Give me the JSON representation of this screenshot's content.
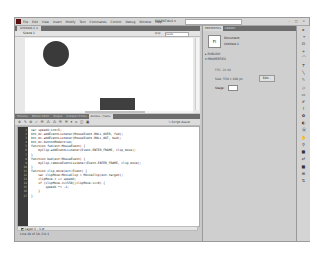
{
  "menubar": {
    "items": [
      "File",
      "Edit",
      "View",
      "Insert",
      "Modify",
      "Text",
      "Commands",
      "Control",
      "Debug",
      "Window",
      "Help"
    ],
    "workspace": "ESSENTIALS ▾",
    "window_buttons": "– □ ×"
  },
  "document": {
    "tab": "Untitled-1 ×",
    "scene": "Scene 1",
    "zoom": "100%"
  },
  "panels": {
    "tabs": [
      "Timeline",
      "Motion Editor",
      "Output",
      "Compiler Errors",
      "Actions - Frame"
    ],
    "active_tab": "Actions - Frame",
    "toolbar_glyphs": "⊕ ✎ ⊕ ✓ ☰ ⁂ ⁂ ☰ ☰ ▾ ⌂ ◫ ▣",
    "script_assist": "✎ Script Assist"
  },
  "code": {
    "lines": [
      {
        "n": "1",
        "t": "var speedX:int=5;"
      },
      {
        "n": "2",
        "t": "btn_mc.addEventListener(MouseEvent.ROLL_OVER, fwd);"
      },
      {
        "n": "3",
        "t": "btn_mc.addEventListener(MouseEvent.ROLL_OUT, bwd);"
      },
      {
        "n": "4",
        "t": "btn_mc.buttonMode=true;"
      },
      {
        "n": "5",
        "t": "function fwd(evt:MouseEvent) {"
      },
      {
        "n": "6",
        "t": "    myClip.addEventListener(Event.ENTER_FRAME, clip_move);"
      },
      {
        "n": "7",
        "t": "}"
      },
      {
        "n": "8",
        "t": "function bwd(evt:MouseEvent) {"
      },
      {
        "n": "9",
        "t": "    myClip.removeEventListener(Event.ENTER_FRAME, clip_move);"
      },
      {
        "n": "10",
        "t": "}"
      },
      {
        "n": "11",
        "t": "function clip_move(evt:Event) {"
      },
      {
        "n": "12",
        "t": "    var clipMove:MovieClip = MovieClip(evt.target);"
      },
      {
        "n": "13",
        "t": "    clipMove.x += speedX;"
      },
      {
        "n": "14",
        "t": "    if (clipMove.x>=550||clipMove.x<=0) {"
      },
      {
        "n": "15",
        "t": "        speedX *= -1;"
      },
      {
        "n": "16",
        "t": "    }"
      },
      {
        "n": "17",
        "t": "}"
      }
    ],
    "layer": "◩ Layer 1 : 1  ⇄",
    "status": "Line 18 of 18, Col 1"
  },
  "properties": {
    "tabs": [
      "PROPERTIES",
      "LIBRARY"
    ],
    "doc_icon": "Fl",
    "doc_label": "Document",
    "doc_file": "Untitled-1",
    "publish": "▸ PUBLISH",
    "props": "▾ PROPERTIES",
    "fps": "FPS: 24.00",
    "size": "Size: 550 x 400 px",
    "edit": "Edit...",
    "stage": "Stage:"
  },
  "tools": [
    "▸",
    "⌖",
    "⊡",
    "✧",
    "⌒",
    "T",
    "╲",
    "✎",
    "◇",
    "▭",
    "✐",
    "⌇",
    "✿",
    "◐",
    "⦿",
    "✋",
    "⚲",
    "■",
    "⇄",
    "■",
    "⊞",
    "⇅"
  ]
}
